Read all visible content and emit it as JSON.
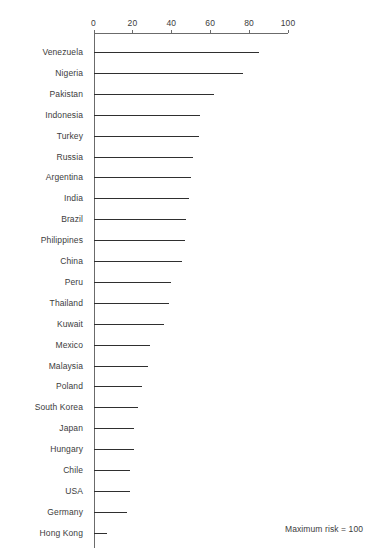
{
  "chart_data": {
    "type": "bar",
    "orientation": "horizontal",
    "title": "",
    "subtitle": "",
    "xlabel": "",
    "ylabel": "",
    "xlim": [
      0,
      100
    ],
    "xticks": [
      0,
      20,
      40,
      60,
      80,
      100
    ],
    "xtick_labels": [
      "0",
      "20",
      "40",
      "60",
      "80",
      "100"
    ],
    "grid": false,
    "legend": false,
    "annotation": "Maximum risk = 100",
    "categories": [
      "Venezuela",
      "Nigeria",
      "Pakistan",
      "Indonesia",
      "Turkey",
      "Russia",
      "Argentina",
      "India",
      "Brazil",
      "Philippines",
      "China",
      "Peru",
      "Thailand",
      "Kuwait",
      "Mexico",
      "Malaysia",
      "Poland",
      "South Korea",
      "Japan",
      "Hungary",
      "Chile",
      "USA",
      "Germany",
      "Hong Kong"
    ],
    "values": [
      85,
      77,
      62,
      55,
      54,
      51,
      50,
      49,
      47.5,
      47,
      45.5,
      40,
      39,
      36,
      29,
      28,
      25,
      23,
      21,
      21,
      19,
      19,
      17,
      7
    ],
    "colors": {
      "bar": "#2f2f2f",
      "axis": "#6b6b6b",
      "text": "#3c3c3c",
      "background": "#ffffff"
    }
  },
  "layout": {
    "plot_left_px": 93.5,
    "plot_right_px": 288,
    "first_row_y_px": 52,
    "row_spacing_px": 20.9,
    "axis_top_y_px": 33,
    "axis_bottom_y_px": 548,
    "tick_label_y_px": 18,
    "label_right_edge_px": 83,
    "annotation_x_px": 285,
    "annotation_y_px": 524
  }
}
